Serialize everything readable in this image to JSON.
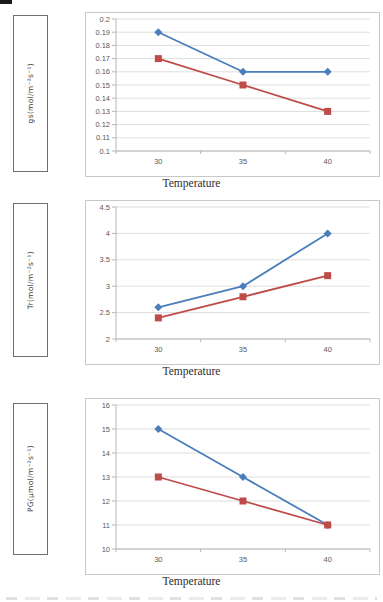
{
  "chart_data": [
    {
      "type": "line",
      "id": "gs",
      "title": "",
      "xlabel": "Temperature",
      "ylabel": "gs(mol/m⁻²s⁻¹)",
      "categories": [
        30,
        35,
        40
      ],
      "xticks": [
        "30",
        "35",
        "40"
      ],
      "yticks": [
        "0.2",
        "0.19",
        "0.18",
        "0.17",
        "0.16",
        "0.15",
        "0.14",
        "0.13",
        "0.12",
        "0.11",
        "0.1"
      ],
      "ylim": [
        0.1,
        0.2
      ],
      "ytick_step": 0.01,
      "grid": true,
      "legend": "none",
      "series": [
        {
          "name": "blue-diamond-series",
          "marker": "diamond",
          "color": "#4a7ebb",
          "values": [
            0.19,
            0.16,
            0.16
          ]
        },
        {
          "name": "red-square-series",
          "marker": "square",
          "color": "#be4b48",
          "values": [
            0.17,
            0.15,
            0.13
          ]
        }
      ]
    },
    {
      "type": "line",
      "id": "Tr",
      "title": "",
      "xlabel": "Temperature",
      "ylabel": "Tr(mol/m⁻²s⁻¹)",
      "categories": [
        30,
        35,
        40
      ],
      "xticks": [
        "30",
        "35",
        "40"
      ],
      "yticks": [
        "4.5",
        "4",
        "3.5",
        "3",
        "2.5",
        "2"
      ],
      "ylim": [
        2,
        4.5
      ],
      "ytick_step": 0.5,
      "grid": true,
      "legend": "none",
      "series": [
        {
          "name": "blue-diamond-series",
          "marker": "diamond",
          "color": "#4a7ebb",
          "values": [
            2.6,
            3.0,
            4.0
          ]
        },
        {
          "name": "red-square-series",
          "marker": "square",
          "color": "#be4b48",
          "values": [
            2.4,
            2.8,
            3.2
          ]
        }
      ]
    },
    {
      "type": "line",
      "id": "PG",
      "title": "",
      "xlabel": "Temperature",
      "ylabel": "PG(μmol/m⁻²s⁻¹)",
      "categories": [
        30,
        35,
        40
      ],
      "xticks": [
        "30",
        "35",
        "40"
      ],
      "yticks": [
        "16",
        "15",
        "14",
        "13",
        "12",
        "11",
        "10"
      ],
      "ylim": [
        10,
        16
      ],
      "ytick_step": 1,
      "grid": true,
      "legend": "none",
      "series": [
        {
          "name": "blue-diamond-series",
          "marker": "diamond",
          "color": "#4a7ebb",
          "values": [
            15,
            13,
            11
          ]
        },
        {
          "name": "red-square-series",
          "marker": "square",
          "color": "#be4b48",
          "values": [
            13,
            12,
            11
          ]
        }
      ]
    }
  ],
  "style": {
    "gridline_color": "#dedede",
    "axis_color": "#b7b7b7",
    "tick_text_color": "#595959"
  }
}
